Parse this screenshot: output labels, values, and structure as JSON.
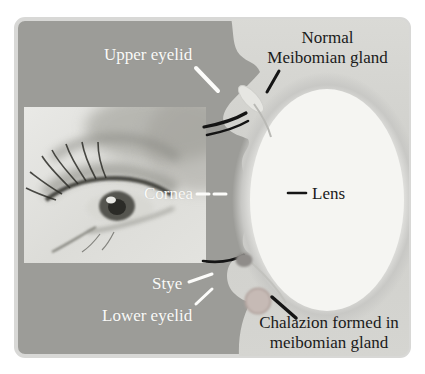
{
  "figure": {
    "labels": {
      "upper_eyelid": "Upper eyelid",
      "meibomian_line1": "Normal",
      "meibomian_line2": "Meibomian gland",
      "cornea": "Cornea",
      "lens": "Lens",
      "stye": "Stye",
      "lower_eyelid": "Lower eyelid",
      "chalazion_line1": "Chalazion formed in",
      "chalazion_line2": "meibomian gland"
    },
    "colors": {
      "panel_background": "#9c9c98",
      "panel_border": "#d8d8d6",
      "tissue": "#d4d4d0",
      "eyeball_white": "#f5f5f2",
      "label_light": "#fafaf8",
      "label_dark": "#1a1a1a",
      "eyelash_black": "#141414",
      "stye": "#8f8c89",
      "chalazion_fill": "#c6bab5",
      "chalazion_outline": "#b2a49f"
    }
  }
}
